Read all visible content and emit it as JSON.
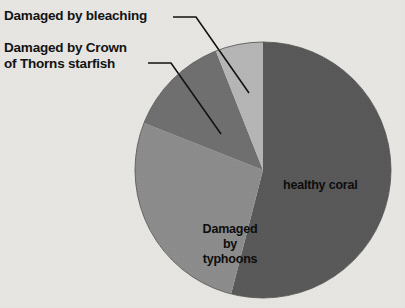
{
  "figure": {
    "background_color": "#e8e7e3",
    "text_color": "#111111"
  },
  "callouts": {
    "bleaching": "Damaged by bleaching",
    "crown_of_thorns": "Damaged by Crown\nof Thorns starfish"
  },
  "slice_labels": {
    "healthy": "healthy coral",
    "typhoons": "Damaged\nby\ntyphoons"
  },
  "chart_data": {
    "type": "pie",
    "title": "",
    "xlabel": "",
    "ylabel": "",
    "legend_position": "none",
    "grid": false,
    "labels": [
      "healthy coral",
      "Damaged by typhoons",
      "Damaged by Crown of Thorns starfish",
      "Damaged by bleaching"
    ],
    "values": [
      54,
      27,
      13,
      6
    ],
    "units": "percent",
    "colors": [
      "#585858",
      "#8c8c8c",
      "#6f6f6f",
      "#b6b6b6"
    ],
    "start_angle_deg": 0,
    "direction": "clockwise",
    "center": [
      263,
      170
    ],
    "radius": 128
  }
}
